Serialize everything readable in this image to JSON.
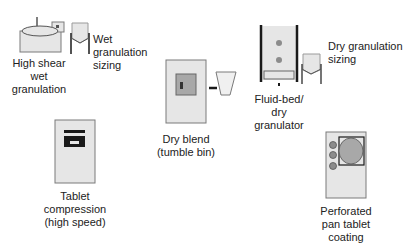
{
  "diagram": {
    "colors": {
      "equipment_fill": "#e6e6e6",
      "equipment_stroke": "#7a7a7a",
      "window_fill": "#a8a8a8",
      "dark": "#1a1a1a",
      "dot": "#8c8c8c"
    },
    "nodes": [
      {
        "id": "high-shear",
        "label": "High shear\nwet\ngranulation",
        "icon": "high-shear-granulator-icon"
      },
      {
        "id": "wet-sizing",
        "label": "Wet\ngranulation\nsizing",
        "icon": "mill-hopper-icon"
      },
      {
        "id": "dry-blend",
        "label": "Dry blend\n(tumble bin)",
        "icon": "tumble-bin-icon"
      },
      {
        "id": "fluid-bed",
        "label": "Fluid-bed/\ndry\ngranulator",
        "icon": "fluid-bed-icon"
      },
      {
        "id": "dry-sizing",
        "label": "Dry granulation\nsizing",
        "icon": "mill-hopper-icon"
      },
      {
        "id": "tablet-press",
        "label": "Tablet\ncompression\n(high speed)",
        "icon": "tablet-press-icon"
      },
      {
        "id": "pan-coater",
        "label": "Perforated\npan tablet\ncoating",
        "icon": "pan-coater-icon"
      }
    ]
  }
}
